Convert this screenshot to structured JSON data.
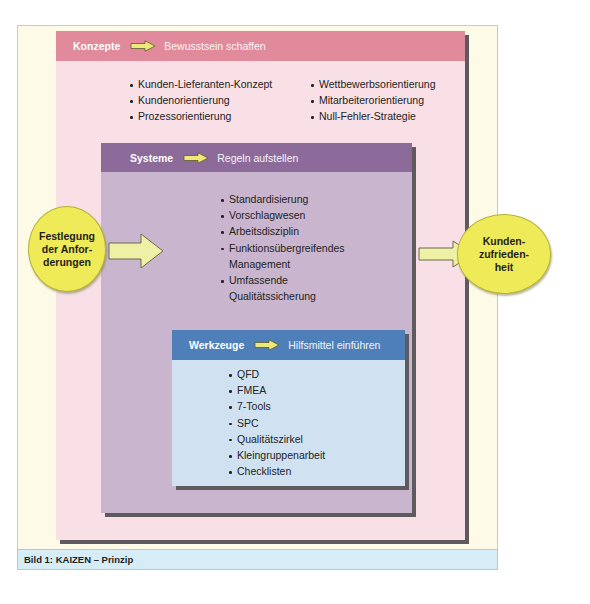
{
  "diagram": {
    "konzepte": {
      "title": "Konzepte",
      "subtitle": "Bewusstsein schaffen",
      "color_header": "#e08a9c",
      "color_body": "#f8e0e6",
      "items_left": [
        "Kunden-Lieferanten-Konzept",
        "Kundenorientierung",
        "Prozessorientierung"
      ],
      "items_right": [
        "Wettbewerbsorientierung",
        "Mitarbeiterorientierung",
        "Null-Fehler-Strategie"
      ]
    },
    "systeme": {
      "title": "Systeme",
      "subtitle": "Regeln aufstellen",
      "color_header": "#8c6b9b",
      "color_body": "#c9b6ce",
      "items": [
        "Standardisierung",
        "Vorschlagwesen",
        "Arbeitsdisziplin",
        "Funktionsübergreifendes",
        "Management",
        "Umfassende",
        "Qualitätssicherung"
      ]
    },
    "werkzeuge": {
      "title": "Werkzeuge",
      "subtitle": "Hilfsmittel einführen",
      "color_header": "#4f7fb9",
      "color_body": "#d0e2f2",
      "items": [
        "QFD",
        "FMEA",
        "7-Tools",
        "SPC",
        "Qualitätszirkel",
        "Kleingruppenarbeit",
        "Checklisten"
      ]
    },
    "input": {
      "line1": "Festlegung",
      "line2": "der Anfor-",
      "line3": "derungen"
    },
    "output": {
      "line1": "Kunden-",
      "line2": "zufrieden-",
      "line3": "heit"
    },
    "arrow_icon": "right-arrow-icon",
    "ellipse_color": "#efea57"
  },
  "caption": {
    "text": "Bild 1: KAIZEN – Prinzip"
  }
}
